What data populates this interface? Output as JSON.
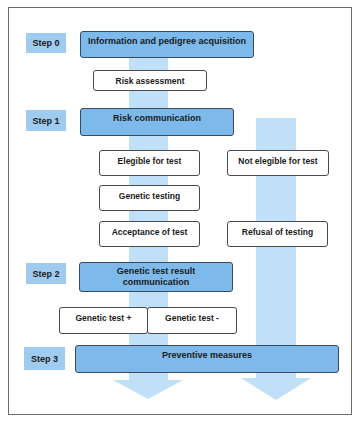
{
  "colors": {
    "step_label_fill": "#9fcbef",
    "phase_box_fill": "#7db9ea",
    "arrow_fill": "#bfe0f7",
    "box_border": "#4a4a4a"
  },
  "steps": [
    {
      "label": "Step  0",
      "phase": "Information and pedigree acquisition"
    },
    {
      "label": "Step  1",
      "phase": "Risk communication"
    },
    {
      "label": "Step  2",
      "phase": "Genetic test result communication"
    },
    {
      "label": "Step  3",
      "phase": "Preventive measures"
    }
  ],
  "boxes": {
    "risk_assessment": "Risk assessment",
    "eligible": "Elegible for test",
    "not_eligible": "Not elegible for test",
    "genetic_testing": "Genetic testing",
    "acceptance": "Acceptance of test",
    "refusal": "Refusal of testing",
    "test_positive": "Genetic test +",
    "test_negative": "Genetic test -"
  }
}
